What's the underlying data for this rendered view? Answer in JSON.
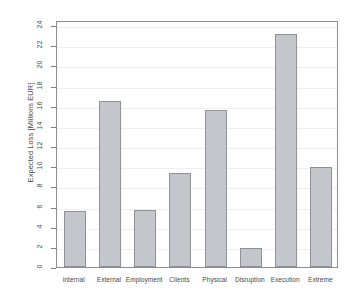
{
  "chart_data": {
    "type": "bar",
    "title": "",
    "xlabel": "",
    "ylabel": "Expected Loss [Millions EUR]",
    "categories": [
      "Internal",
      "External",
      "Employment",
      "Clients",
      "Physical",
      "Disruption",
      "Execution",
      "Extreme"
    ],
    "values": [
      5.6,
      16.5,
      5.7,
      9.3,
      15.6,
      1.9,
      23.1,
      9.9
    ],
    "ylim": [
      0,
      24.5
    ],
    "yticks": [
      0,
      2,
      4,
      6,
      8,
      10,
      12,
      14,
      16,
      18,
      20,
      22,
      24
    ],
    "grid": true,
    "legend": null,
    "bar_fill_color": "#c3c7cc",
    "bar_border_color": "#8e9196",
    "frame_color": "#8c8c8c",
    "grid_color": "#efefef",
    "background_color": "#ffffff"
  }
}
